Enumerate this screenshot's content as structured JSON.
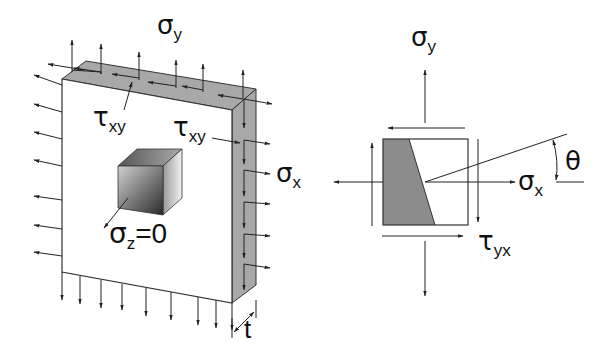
{
  "figure": {
    "left_panel": {
      "title": "Thin plate under plane stress",
      "labels": {
        "sigma_y": {
          "symbol": "σ",
          "sub": "y"
        },
        "tau_xy_top": {
          "symbol": "τ",
          "sub": "xy"
        },
        "tau_xy_right": {
          "symbol": "τ",
          "sub": "xy"
        },
        "sigma_x": {
          "symbol": "σ",
          "sub": "x"
        },
        "sigma_z": {
          "symbol": "σ",
          "sub": "z",
          "suffix": "=0"
        },
        "thickness": "t"
      }
    },
    "right_panel": {
      "title": "Stress element with inclined plane",
      "labels": {
        "sigma_y": {
          "symbol": "σ",
          "sub": "y"
        },
        "sigma_x": {
          "symbol": "σ",
          "sub": "x"
        },
        "tau_yx": {
          "symbol": "τ",
          "sub": "yx"
        },
        "theta": "θ"
      }
    },
    "colors": {
      "line": "#222222",
      "plate_edge_fill": "#a8a8a8",
      "shaded_region": "#8c8c8c",
      "background": "#ffffff"
    }
  }
}
